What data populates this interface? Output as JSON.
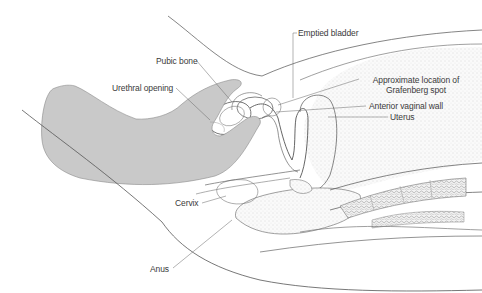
{
  "figure": {
    "type": "anatomical cross-section illustration",
    "colors": {
      "hand_fill": "#c9c9c9",
      "line": "#555555",
      "stipple": "#d6d6d6",
      "label_text": "#3a3a3a"
    }
  },
  "labels": {
    "emptied_bladder": "Emptied bladder",
    "pubic_bone": "Pubic bone",
    "urethral_opening": "Urethral opening",
    "grafenberg_line1": "Approximate location of",
    "grafenberg_line2": "Grafenberg spot",
    "anterior_vaginal_wall": "Anterior vaginal wall",
    "uterus": "Uterus",
    "cervix": "Cervix",
    "anus": "Anus"
  }
}
